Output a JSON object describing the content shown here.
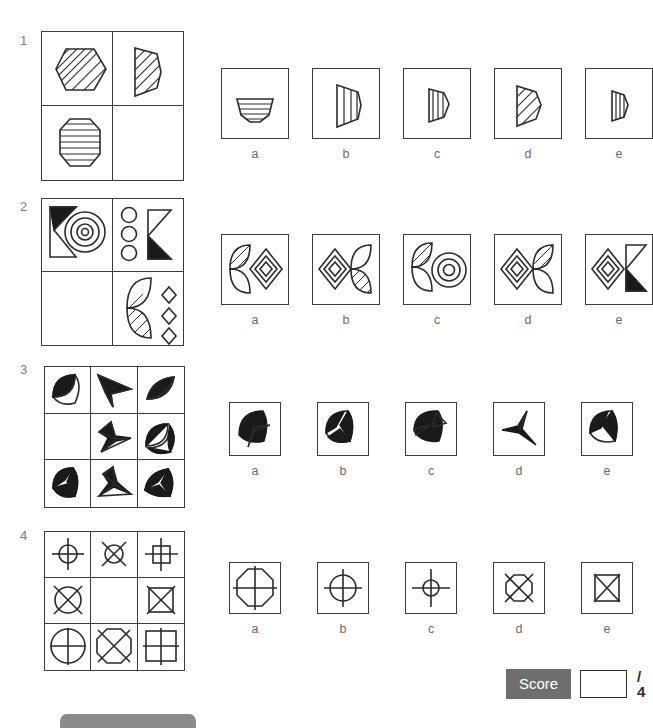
{
  "page": {
    "type": "non-verbal-reasoning-worksheet",
    "question_count": 4,
    "option_labels": [
      "a",
      "b",
      "c",
      "d",
      "e"
    ],
    "colors": {
      "stroke": "#2b2b2b",
      "fill_black": "#1a1a1a",
      "score_badge_bg": "#6e6e6e",
      "number_gray": "#7d7d7d",
      "footer_gray": "#8a8a8a"
    }
  },
  "questions": [
    {
      "number": "1",
      "matrix": {
        "rows": 2,
        "cols": 2,
        "cells": [
          "hexagon-diagonal-hatched",
          "narrow-hexagon-diagonal-hatched",
          "octagon-horizontal-striped",
          "empty"
        ],
        "missing_cell": 4
      },
      "options": [
        {
          "label": "a",
          "shape": "squashed-hexagon-horizontal-striped"
        },
        {
          "label": "b",
          "shape": "half-hexagon-vertical-striped-wide"
        },
        {
          "label": "c",
          "shape": "narrow-half-hexagon-vertical-striped"
        },
        {
          "label": "d",
          "shape": "half-hexagon-diagonal-hatched"
        },
        {
          "label": "e",
          "shape": "narrow-half-hexagon-vertical-lines"
        }
      ]
    },
    {
      "number": "2",
      "matrix": {
        "rows": 2,
        "cols": 2,
        "cells": [
          "arrow-chevron-black-top-with-concentric-circles",
          "three-circles-and-chevron-black-bottom",
          "empty",
          "lens-leaf-hatched-and-three-diamonds"
        ],
        "missing_cell": 3
      },
      "options": [
        {
          "label": "a",
          "shape": "lens-hatched-left-concentric-diamond-right"
        },
        {
          "label": "b",
          "shape": "concentric-diamond-left-lens-hatched-right"
        },
        {
          "label": "c",
          "shape": "lens-hatched-left-concentric-circles-right"
        },
        {
          "label": "d",
          "shape": "concentric-diamond-left-lens-hatched-right-alt"
        },
        {
          "label": "e",
          "shape": "concentric-diamond-and-black-chevron"
        }
      ]
    },
    {
      "number": "3",
      "matrix": {
        "rows": 3,
        "cols": 3,
        "cells": [
          "leaf-black-split",
          "three-point-star-black",
          "leaf-black-outline",
          "empty",
          "three-point-star-outline",
          "bowtie-leaf-black-white",
          "leaf-pinwheel-black-white",
          "three-point-star-black-white",
          "leaf-checkered-black-white"
        ],
        "missing_cell": 4
      },
      "options": [
        {
          "label": "a",
          "shape": "leaf-black-with-white-arrow"
        },
        {
          "label": "b",
          "shape": "leaf-black-white-zigzag"
        },
        {
          "label": "c",
          "shape": "leaf-black-with-white-wedge"
        },
        {
          "label": "d",
          "shape": "three-point-star-black-thin"
        },
        {
          "label": "e",
          "shape": "leaf-black-white-split-diagonal"
        }
      ]
    },
    {
      "number": "4",
      "matrix": {
        "rows": 3,
        "cols": 3,
        "cells": [
          "circle-with-cross-small",
          "circle-with-diagonal-cross-small",
          "square-with-cross-small",
          "circle-with-diagonal-cross-medium",
          "empty",
          "square-with-diagonal-cross-medium",
          "circle-with-cross-large",
          "octagon-with-diagonal-cross-large",
          "square-with-cross-large"
        ],
        "missing_cell": 5
      },
      "options": [
        {
          "label": "a",
          "shape": "octagon-with-cross-large"
        },
        {
          "label": "b",
          "shape": "circle-with-cross-medium"
        },
        {
          "label": "c",
          "shape": "circle-with-cross-small"
        },
        {
          "label": "d",
          "shape": "octagon-with-diagonal-cross-medium"
        },
        {
          "label": "e",
          "shape": "square-with-diagonal-cross-medium"
        }
      ]
    }
  ],
  "score": {
    "label": "Score",
    "value": "",
    "total": "/ 4"
  }
}
